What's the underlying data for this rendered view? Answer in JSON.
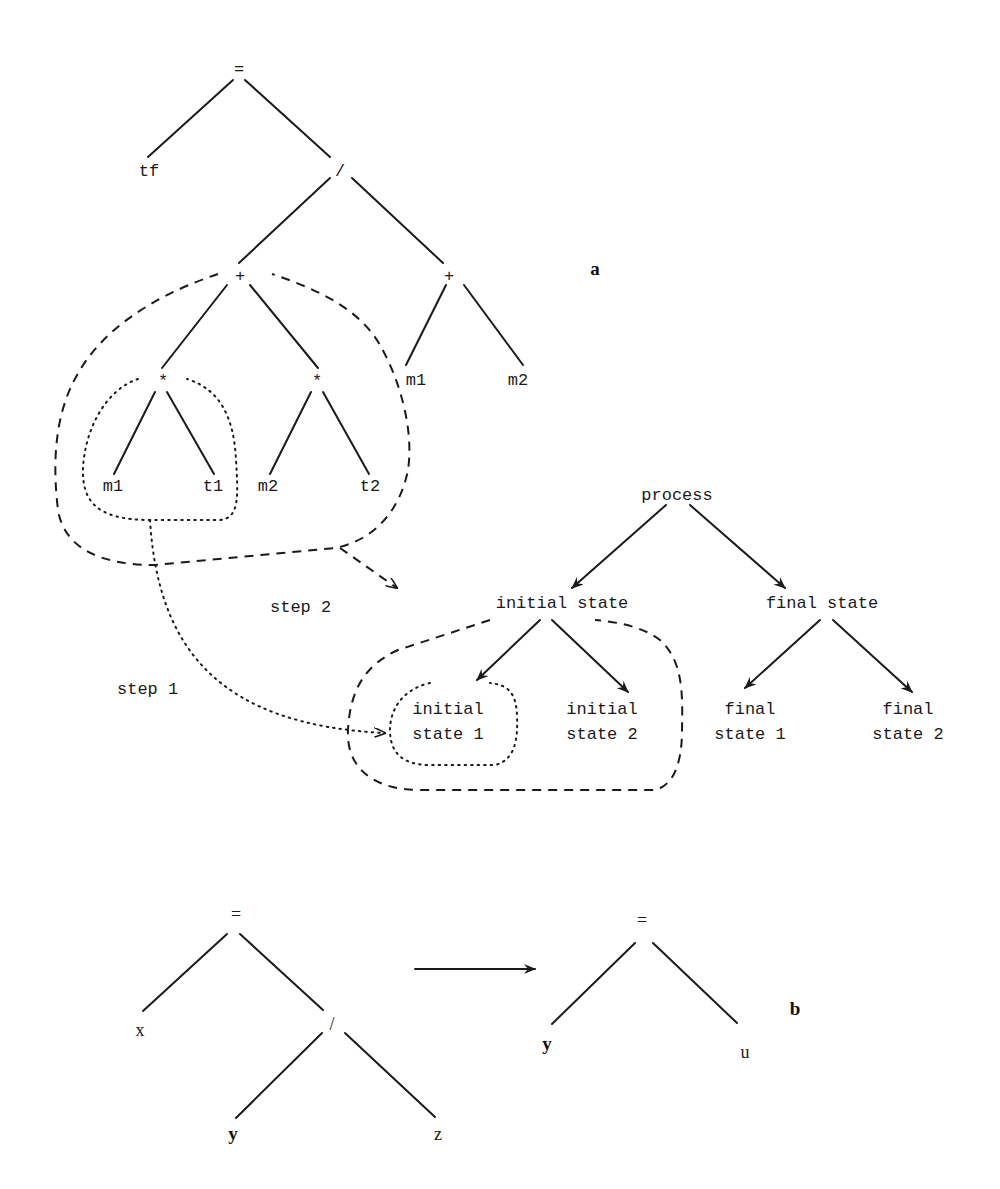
{
  "panel_a": {
    "label": "a",
    "expression_tree": {
      "root": "=",
      "left_leaf": "tf",
      "div": "/",
      "plus_left": "+",
      "plus_right": "+",
      "times_left": "*",
      "times_right": "*",
      "leaf_m1_a": "m1",
      "leaf_t1": "t1",
      "leaf_m2_a": "m2",
      "leaf_t2": "t2",
      "leaf_m1_b": "m1",
      "leaf_m2_b": "m2"
    },
    "process_tree": {
      "root": "process",
      "initial_state": "initial state",
      "final_state": "final state",
      "initial_state_1": [
        "initial",
        "state 1"
      ],
      "initial_state_2": [
        "initial",
        "state 2"
      ],
      "final_state_1": [
        "final",
        "state 1"
      ],
      "final_state_2": [
        "final",
        "state 2"
      ]
    },
    "steps": {
      "step1": "step 1",
      "step2": "step 2"
    }
  },
  "panel_b": {
    "label": "b",
    "left_tree": {
      "root": "=",
      "left_leaf": "x",
      "div": "/",
      "div_left": "y",
      "div_right": "z"
    },
    "right_tree": {
      "root": "=",
      "left_leaf": "y",
      "right_leaf": "u"
    }
  },
  "colors": {
    "ink": "#1a1a1a",
    "background": "#ffffff"
  }
}
